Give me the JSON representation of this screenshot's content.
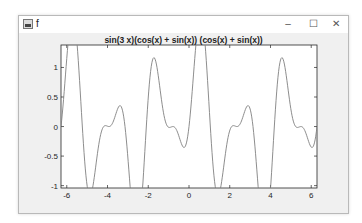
{
  "window": {
    "title": "f",
    "icon": "matlab-figure-icon",
    "controls": {
      "minimize": "–",
      "maximize": "☐",
      "close": "✕"
    }
  },
  "chart_data": {
    "type": "line",
    "title": "sin(3 x)(cos(x) + sin(x)) (cos(x) + sin(x))",
    "function": "sin(3x)*(cos(x)+sin(x))^2",
    "xlabel": "",
    "ylabel": "",
    "xlim": [
      -6.2832,
      6.2832
    ],
    "ylim": [
      -1.04,
      1.38
    ],
    "xticks": [
      -6,
      -4,
      -2,
      0,
      2,
      4,
      6
    ],
    "xtick_labels": [
      "-6",
      "-4",
      "-2",
      "0",
      "2",
      "4",
      "6"
    ],
    "yticks": [
      -1,
      -0.5,
      0,
      0.5,
      1
    ],
    "ytick_labels": [
      "-1",
      "-0.5",
      "0",
      "0.5",
      "1"
    ],
    "grid": false,
    "line_color": "#808080",
    "samples": 400
  }
}
